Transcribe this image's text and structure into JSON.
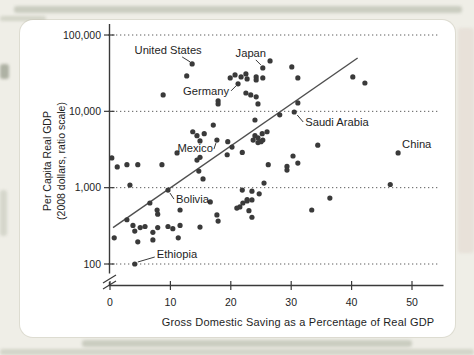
{
  "page": {
    "background_color": "#efeee7",
    "panel_color": "#ffffff",
    "ink_color": "#3a3a3a",
    "text_color": "#1e1e1e",
    "grid_color": "#5c5c5c"
  },
  "chart_data": {
    "type": "scatter",
    "xlabel": "Gross Domestic Saving as a Percentage of Real GDP",
    "ylabel_line1": "Per Capita Real GDP",
    "ylabel_line2": "(2008 dollars, ratio scale)",
    "y_scale": "log",
    "grid": "horizontal-dotted",
    "axis_break": true,
    "xlim": [
      0,
      55
    ],
    "ylim": [
      100,
      100000
    ],
    "x_ticks": [
      0,
      10,
      20,
      30,
      40,
      50
    ],
    "y_ticks": [
      100,
      1000,
      10000,
      100000
    ],
    "y_tick_labels": [
      "100",
      "1,000",
      "10,000",
      "100,000"
    ],
    "trend_line": {
      "x1": 0.5,
      "y1": 300,
      "x2": 41,
      "y2": 50000
    },
    "labeled_points": [
      {
        "name": "United States",
        "x": 13.6,
        "y": 41800,
        "anchor": "middle",
        "ldx": -24,
        "ldy": -10,
        "line": [
          -10,
          -7,
          -2,
          -2
        ]
      },
      {
        "name": "Japan",
        "x": 25.3,
        "y": 37100,
        "anchor": "middle",
        "ldx": -12,
        "ldy": -11,
        "line": [
          -7,
          -8,
          -2,
          -3
        ]
      },
      {
        "name": "Germany",
        "x": 21.2,
        "y": 22900,
        "anchor": "end",
        "ldx": -9,
        "ldy": 11,
        "line": [
          -7,
          7,
          -2,
          2
        ]
      },
      {
        "name": "Saudi Arabia",
        "x": 30.5,
        "y": 9800,
        "anchor": "start",
        "ldx": 11,
        "ldy": 14,
        "line": [
          9,
          10,
          3,
          3
        ]
      },
      {
        "name": "Mexico",
        "x": 17.7,
        "y": 4200,
        "anchor": "end",
        "ldx": -4,
        "ldy": 12,
        "line": [
          -3,
          9,
          -1,
          3
        ]
      },
      {
        "name": "China",
        "x": 47.7,
        "y": 2850,
        "anchor": "start",
        "ldx": 4,
        "ldy": -5,
        "line": null
      },
      {
        "name": "Bolivia",
        "x": 9.6,
        "y": 930,
        "anchor": "start",
        "ldx": 8,
        "ldy": 13,
        "line": [
          6,
          9,
          2,
          3
        ]
      },
      {
        "name": "Ethiopia",
        "x": 4.1,
        "y": 100,
        "anchor": "start",
        "ldx": 22,
        "ldy": -6,
        "line": [
          20,
          -7,
          3,
          -2
        ]
      }
    ],
    "points": [
      [
        12.7,
        29100
      ],
      [
        8.8,
        16400
      ],
      [
        19.9,
        27400
      ],
      [
        20.7,
        30000
      ],
      [
        21.7,
        28200
      ],
      [
        22.5,
        30900
      ],
      [
        22.7,
        26600
      ],
      [
        24.2,
        28200
      ],
      [
        24.2,
        25800
      ],
      [
        25.3,
        27400
      ],
      [
        26.5,
        45800
      ],
      [
        30.1,
        38200
      ],
      [
        31.1,
        27400
      ],
      [
        22.5,
        17400
      ],
      [
        23.3,
        16400
      ],
      [
        24.2,
        15500
      ],
      [
        24.5,
        12500
      ],
      [
        17.9,
        13700
      ],
      [
        17.9,
        12500
      ],
      [
        17.1,
        6600
      ],
      [
        11.1,
        2850
      ],
      [
        13.7,
        5400
      ],
      [
        14.4,
        4800
      ],
      [
        14.9,
        4100
      ],
      [
        15.6,
        5100
      ],
      [
        19.5,
        4000
      ],
      [
        20.2,
        3400
      ],
      [
        21.9,
        2900
      ],
      [
        23.7,
        4200
      ],
      [
        24.0,
        4800
      ],
      [
        25.3,
        4200
      ],
      [
        19.4,
        2700
      ],
      [
        14.9,
        2500
      ],
      [
        28.1,
        9000
      ],
      [
        31.1,
        12900
      ],
      [
        24.0,
        7700
      ],
      [
        40.2,
        28200
      ],
      [
        42.2,
        23500
      ],
      [
        24.5,
        4500
      ],
      [
        25.2,
        5100
      ],
      [
        26.0,
        5400
      ],
      [
        24.5,
        3900
      ],
      [
        25.0,
        4000
      ],
      [
        30.3,
        2600
      ],
      [
        31.1,
        2100
      ],
      [
        26.2,
        2000
      ],
      [
        29.3,
        1900
      ],
      [
        29.3,
        1700
      ],
      [
        25.5,
        1150
      ],
      [
        23.5,
        900
      ],
      [
        24.7,
        830
      ],
      [
        22.7,
        670
      ],
      [
        21.5,
        560
      ],
      [
        23.0,
        500
      ],
      [
        23.5,
        410
      ],
      [
        21.9,
        930
      ],
      [
        33.4,
        510
      ],
      [
        36.4,
        730
      ],
      [
        46.4,
        1100
      ],
      [
        34.4,
        3600
      ],
      [
        0.3,
        2450
      ],
      [
        1.2,
        1870
      ],
      [
        2.8,
        2000
      ],
      [
        4.6,
        2000
      ],
      [
        8.6,
        2000
      ],
      [
        14.4,
        2300
      ],
      [
        14.7,
        1650
      ],
      [
        15.4,
        1300
      ],
      [
        3.3,
        1080
      ],
      [
        6.6,
        630
      ],
      [
        7.8,
        510
      ],
      [
        7.9,
        450
      ],
      [
        2.8,
        380
      ],
      [
        3.8,
        320
      ],
      [
        4.1,
        270
      ],
      [
        5.0,
        300
      ],
      [
        5.8,
        310
      ],
      [
        7.1,
        260
      ],
      [
        7.9,
        300
      ],
      [
        9.6,
        310
      ],
      [
        10.4,
        290
      ],
      [
        11.6,
        320
      ],
      [
        0.7,
        220
      ],
      [
        4.6,
        195
      ],
      [
        7.1,
        207
      ],
      [
        11.3,
        220
      ],
      [
        11.6,
        510
      ],
      [
        16.6,
        650
      ],
      [
        17.7,
        440
      ],
      [
        17.9,
        365
      ],
      [
        14.9,
        305
      ],
      [
        21.0,
        540
      ],
      [
        22.0,
        630
      ],
      [
        22.7,
        700
      ],
      [
        23.5,
        690
      ]
    ]
  }
}
